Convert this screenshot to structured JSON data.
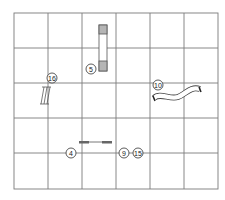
{
  "diagram": {
    "type": "agility-course-map",
    "grid": {
      "columns": 6,
      "rows": 5,
      "line_color": "#777777"
    },
    "obstacles": [
      {
        "id": "obstacle-5",
        "number": "5",
        "kind": "contact-obstacle"
      },
      {
        "id": "obstacle-16",
        "number": "16",
        "kind": "ladder-jump"
      },
      {
        "id": "obstacle-10",
        "number": "10",
        "kind": "curved-tunnel"
      },
      {
        "id": "obstacle-4",
        "number": "4",
        "kind": "bar-jump"
      },
      {
        "id": "obstacle-9",
        "number": "9",
        "kind": "marker"
      },
      {
        "id": "obstacle-15",
        "number": "15",
        "kind": "marker"
      }
    ]
  }
}
